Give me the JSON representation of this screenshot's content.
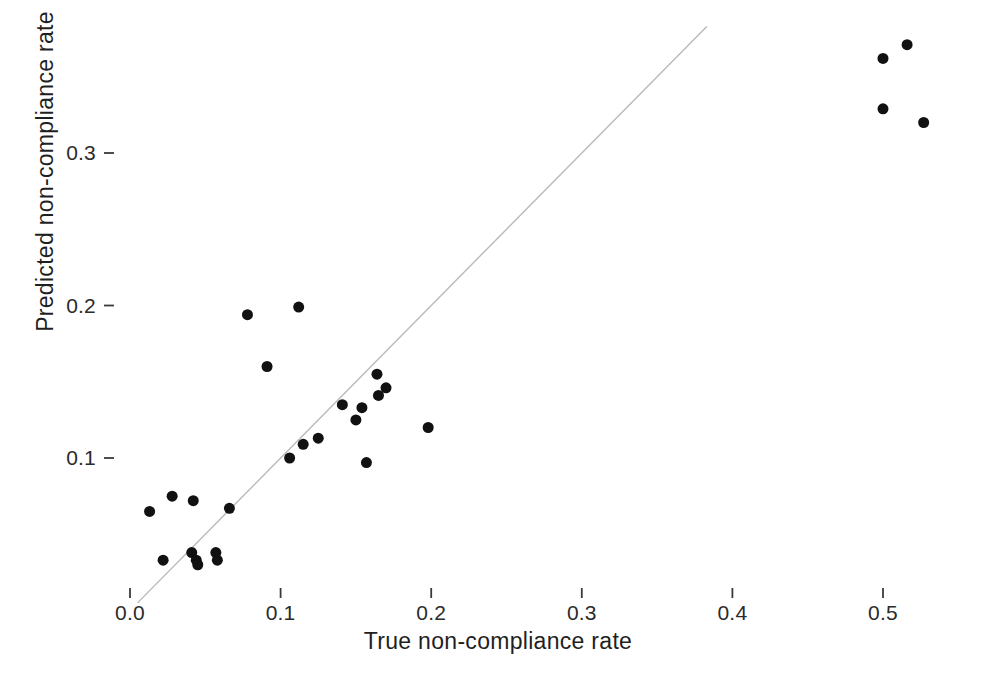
{
  "chart_data": {
    "type": "scatter",
    "title": "",
    "xlabel": "True non-compliance rate",
    "ylabel": "Predicted non-compliance rate",
    "xlim": [
      -0.012,
      0.572
    ],
    "ylim": [
      0.0,
      0.392
    ],
    "xticks": [
      0.0,
      0.1,
      0.2,
      0.3,
      0.4,
      0.5
    ],
    "xticklabels": [
      "0.0",
      "0.1",
      "0.2",
      "0.3",
      "0.4",
      "0.5"
    ],
    "yticks": [
      0.1,
      0.2,
      0.3
    ],
    "yticklabels": [
      "0.1",
      "0.2",
      "0.3"
    ],
    "grid": false,
    "legend": "none",
    "point_color": "#111111",
    "point_size": 11,
    "reference_line": {
      "kind": "identity",
      "label": "y = x",
      "color": "#b9b9b9",
      "style": "solid",
      "x0": 0.005,
      "y0": 0.005,
      "x1": 0.383,
      "y1": 0.383
    },
    "points": [
      {
        "x": 0.013,
        "y": 0.065
      },
      {
        "x": 0.022,
        "y": 0.033
      },
      {
        "x": 0.028,
        "y": 0.075
      },
      {
        "x": 0.041,
        "y": 0.038
      },
      {
        "x": 0.042,
        "y": 0.072
      },
      {
        "x": 0.044,
        "y": 0.033
      },
      {
        "x": 0.045,
        "y": 0.03
      },
      {
        "x": 0.057,
        "y": 0.038
      },
      {
        "x": 0.058,
        "y": 0.033
      },
      {
        "x": 0.066,
        "y": 0.067
      },
      {
        "x": 0.078,
        "y": 0.194
      },
      {
        "x": 0.091,
        "y": 0.16
      },
      {
        "x": 0.106,
        "y": 0.1
      },
      {
        "x": 0.112,
        "y": 0.199
      },
      {
        "x": 0.115,
        "y": 0.109
      },
      {
        "x": 0.125,
        "y": 0.113
      },
      {
        "x": 0.141,
        "y": 0.135
      },
      {
        "x": 0.15,
        "y": 0.125
      },
      {
        "x": 0.154,
        "y": 0.133
      },
      {
        "x": 0.157,
        "y": 0.097
      },
      {
        "x": 0.164,
        "y": 0.155
      },
      {
        "x": 0.165,
        "y": 0.141
      },
      {
        "x": 0.17,
        "y": 0.146
      },
      {
        "x": 0.198,
        "y": 0.12
      },
      {
        "x": 0.5,
        "y": 0.329
      },
      {
        "x": 0.5,
        "y": 0.362
      },
      {
        "x": 0.516,
        "y": 0.371
      },
      {
        "x": 0.527,
        "y": 0.32
      }
    ]
  },
  "axes": {
    "x_title": "True non-compliance rate",
    "y_title": "Predicted non-compliance rate"
  },
  "style": {
    "panel_background": "#ffffff",
    "tick_color": "#3a3a3a",
    "point_color": "#111111",
    "line_color": "#b9b9b9"
  }
}
